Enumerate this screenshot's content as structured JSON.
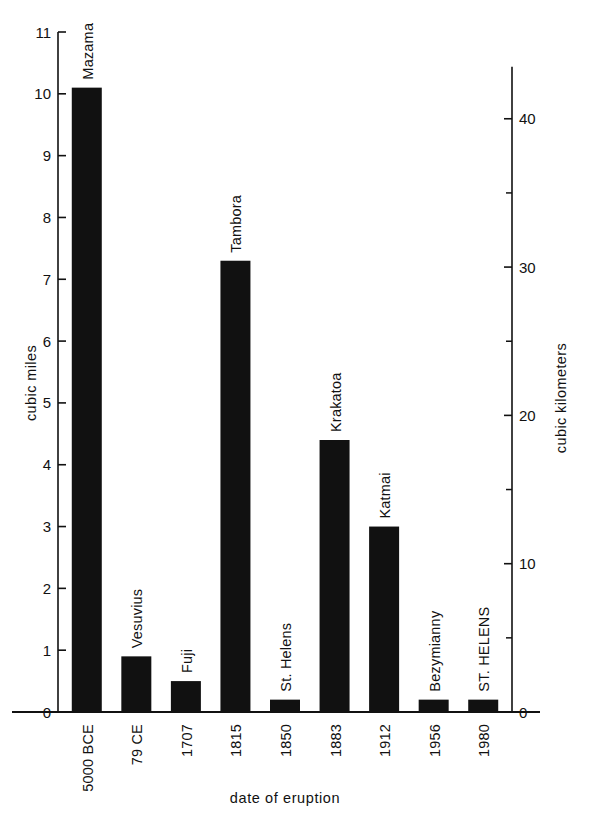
{
  "chart_data": {
    "type": "bar",
    "title": "",
    "subtitle": "",
    "xlabel": "date of eruption",
    "ylabel": "cubic miles",
    "y2label": "cubic kilometers",
    "grid": false,
    "legend": "none",
    "ylim": [
      0,
      11
    ],
    "y2lim": [
      0,
      45.85
    ],
    "yticks": [
      "0",
      "1",
      "2",
      "3",
      "4",
      "5",
      "6",
      "7",
      "8",
      "9",
      "10",
      "11"
    ],
    "ytick_values": [
      0,
      1,
      2,
      3,
      4,
      5,
      6,
      7,
      8,
      9,
      10,
      11
    ],
    "y2ticks": [
      "0",
      "10",
      "20",
      "30",
      "40"
    ],
    "y2tick_values": [
      0,
      10,
      20,
      30,
      40
    ],
    "y2minor_values": [
      5,
      15,
      25,
      35
    ],
    "categories": [
      "5000 BCE",
      "79 CE",
      "1707",
      "1815",
      "1850",
      "1883",
      "1912",
      "1956",
      "1980"
    ],
    "point_labels": [
      "Mazama",
      "Vesuvius",
      "Fuji",
      "Tambora",
      "St. Helens",
      "Krakatoa",
      "Katmai",
      "Bezymianny",
      "ST. HELENS"
    ],
    "values": [
      10.1,
      0.9,
      0.5,
      7.3,
      0.2,
      4.4,
      3.0,
      0.2,
      0.2
    ],
    "units": "cubic miles",
    "bar_color": "#111111"
  },
  "colors": {
    "background": "#ffffff",
    "ink": "#111111",
    "bar": "#111111"
  }
}
